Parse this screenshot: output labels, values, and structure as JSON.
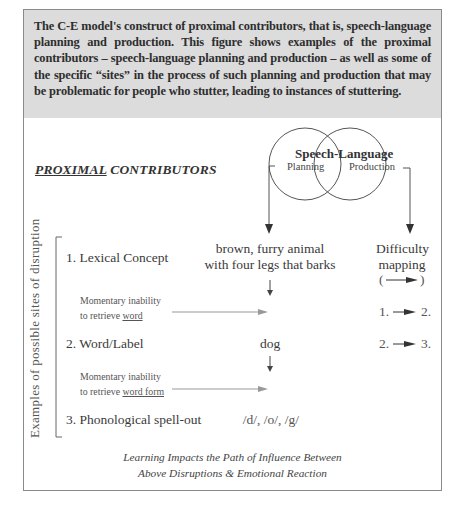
{
  "caption": {
    "text": "The C-E model's construct of proximal contributors, that is, speech-language planning and production. This figure shows examples of the proximal contributors – speech-language planning and production – as well as some of the specific “sites” in the process of such planning and production that may be problematic for people who stutter, leading to instances of stuttering."
  },
  "diagram": {
    "title_underlined": "PROXIMAL",
    "title_rest": " CONTRIBUTORS",
    "venn": {
      "title": "Speech-Language",
      "left_label": "Planning",
      "right_label": "Production"
    },
    "vertical_label": "Examples of possible sites of disruption",
    "rows": [
      {
        "label": "1. Lexical Concept",
        "example_line1": "brown, furry animal",
        "example_line2": "with four legs that barks"
      },
      {
        "label": "2. Word/Label",
        "example_line1": "dog"
      },
      {
        "label": "3. Phonological spell-out",
        "example_line1": "/d/, /o/, /g/"
      }
    ],
    "disruptions": [
      {
        "line1": "Momentary inability",
        "line2_prefix": "to retrieve ",
        "line2_underlined": "word"
      },
      {
        "line1": "Momentary inability",
        "line2_prefix": "to retrieve ",
        "line2_underlined": "word form"
      }
    ],
    "difficulty_mapping": {
      "heading_line1": "Difficulty",
      "heading_line2": "mapping",
      "legend_open": "(",
      "legend_close": ")",
      "mappings": [
        {
          "from": "1.",
          "to": "2."
        },
        {
          "from": "2.",
          "to": "3."
        }
      ]
    },
    "footer": {
      "line1": "Learning Impacts the Path of Influence Between",
      "line2": "Above Disruptions & Emotional Reaction"
    }
  }
}
